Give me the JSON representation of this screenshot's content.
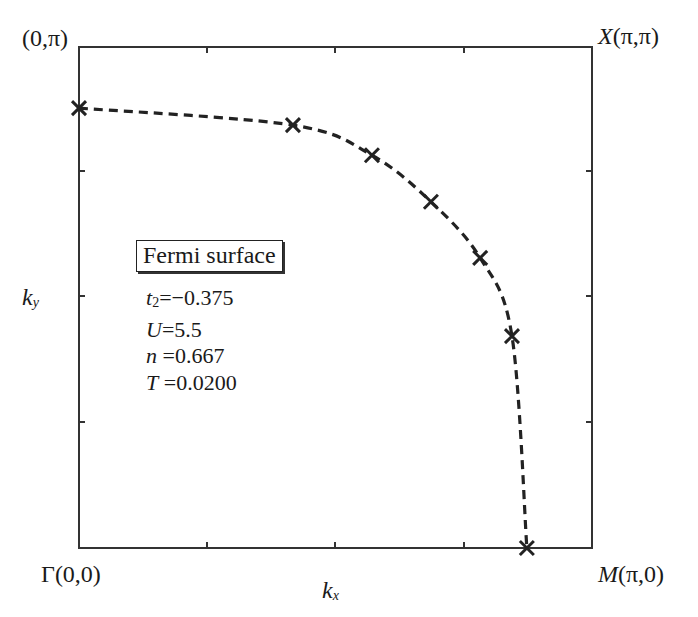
{
  "chart_data": {
    "type": "line",
    "title": "",
    "xlabel": "k_x",
    "ylabel": "k_y",
    "xlim": [
      0,
      3.14159
    ],
    "ylim": [
      0,
      3.14159
    ],
    "grid": false,
    "corner_labels": {
      "top_left": "(0,π)",
      "top_right": "X(π,π)",
      "bottom_left": "Γ(0,0)",
      "bottom_right": "M(π,0)"
    },
    "series": [
      {
        "name": "Fermi surface",
        "style": "dashed line with x markers",
        "color": "#222222",
        "x_over_pi": [
          0.0,
          0.417,
          0.571,
          0.686,
          0.782,
          0.844,
          0.873
        ],
        "y_over_pi": [
          0.878,
          0.844,
          0.784,
          0.691,
          0.579,
          0.423,
          0.0
        ]
      }
    ],
    "x_ticks_over_pi": [
      0,
      0.25,
      0.5,
      0.75,
      1
    ],
    "y_ticks_over_pi": [
      0,
      0.25,
      0.5,
      0.75,
      1
    ],
    "legend": {
      "title": "Fermi surface",
      "position": "left-center"
    },
    "annotations": [
      "t2=−0.375",
      "U=5.5",
      "n =0.667",
      "T =0.0200"
    ]
  },
  "labels": {
    "top_left": "(0,π)",
    "top_right_sym": "X",
    "top_right_coords": "(π,π)",
    "bottom_left": "Γ(0,0)",
    "bottom_right_sym": "M",
    "bottom_right_coords": "(π,0)",
    "xlabel_main": "k",
    "xlabel_sub": "x",
    "ylabel_main": "k",
    "ylabel_sub": "y"
  },
  "legend": {
    "title": "Fermi surface",
    "params": [
      {
        "sym": "t",
        "sub": "2",
        "val": "=−0.375"
      },
      {
        "sym": "U",
        "sub": "",
        "val": "=5.5"
      },
      {
        "sym": "n",
        "sub": "",
        "val": " =0.667"
      },
      {
        "sym": "T",
        "sub": "",
        "val": " =0.0200"
      }
    ]
  }
}
